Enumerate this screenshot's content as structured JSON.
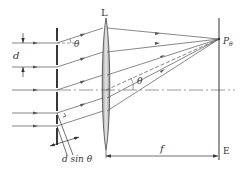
{
  "diagram": {
    "labels": {
      "lens": "L",
      "screen": "E",
      "point": "P",
      "point_sub": "θ",
      "slit_spacing": "d",
      "angle_top": "θ",
      "angle_axis": "θ",
      "path_difference": "d sin θ",
      "focal_length": "f"
    },
    "colors": {
      "line": "#555555",
      "slit": "#222222",
      "lens_fill": "#c8c8c8",
      "lens_edge": "#444444",
      "text": "#333333"
    },
    "incident_ray_ys": [
      43,
      67,
      90,
      113,
      136
    ],
    "slit_x": 57,
    "lens_x": 106,
    "screen_x": 219,
    "focus_y": 39,
    "axis_y": 90
  }
}
